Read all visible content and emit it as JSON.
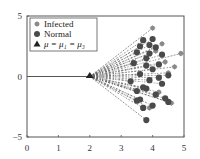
{
  "chart_data": {
    "type": "scatter",
    "title": "",
    "xlabel": "",
    "ylabel": "",
    "xlim": [
      0,
      5
    ],
    "ylim": [
      -5,
      5
    ],
    "xticks": [
      0,
      1,
      2,
      3,
      4,
      5
    ],
    "yticks": [
      5,
      0,
      -5
    ],
    "xtick_labels": [
      "0",
      "1",
      "2",
      "3",
      "4",
      "5"
    ],
    "ytick_labels": [
      "5",
      "0",
      "−5"
    ],
    "grid": false,
    "legend_position": "upper left",
    "legend": [
      {
        "label": "Infected",
        "marker": "star",
        "color": "#8a8a8a"
      },
      {
        "label": "Normal",
        "marker": "circle",
        "color": "#4a4a4a"
      },
      {
        "label": "μ = μ₁ = μ₃",
        "marker": "triangle",
        "color": "#222222"
      }
    ],
    "center": {
      "label": "μ = μ₁ = μ₃",
      "x": 2.0,
      "y": 0.0
    },
    "baseline": {
      "from": [
        0,
        0
      ],
      "to": [
        2.0,
        0
      ]
    },
    "series": [
      {
        "name": "Infected",
        "marker": "star",
        "color": "#8a8a8a",
        "points": [
          [
            4.0,
            4.0
          ],
          [
            4.9,
            1.9
          ],
          [
            4.3,
            2.7
          ],
          [
            4.5,
            0.3
          ],
          [
            4.6,
            -2.2
          ],
          [
            4.2,
            -1.3
          ],
          [
            4.4,
            1.2
          ],
          [
            3.9,
            -2.6
          ],
          [
            4.7,
            0.8
          ],
          [
            4.1,
            2.1
          ]
        ]
      },
      {
        "name": "Normal",
        "marker": "circle",
        "color": "#4a4a4a",
        "points": [
          [
            3.8,
            -3.6
          ],
          [
            3.6,
            -1.9
          ],
          [
            4.5,
            -2.1
          ],
          [
            3.7,
            3.0
          ],
          [
            3.9,
            2.6
          ],
          [
            4.1,
            2.4
          ],
          [
            3.5,
            2.0
          ],
          [
            3.8,
            1.5
          ],
          [
            4.2,
            1.0
          ],
          [
            4.0,
            0.6
          ],
          [
            3.6,
            0.2
          ],
          [
            3.9,
            -0.3
          ],
          [
            4.3,
            -0.6
          ],
          [
            3.7,
            -0.9
          ],
          [
            4.1,
            -1.5
          ],
          [
            3.5,
            -1.2
          ],
          [
            4.4,
            -1.8
          ],
          [
            3.8,
            0.9
          ],
          [
            4.0,
            -2.4
          ],
          [
            3.4,
            1.1
          ],
          [
            4.2,
            -0.1
          ],
          [
            3.6,
            2.5
          ],
          [
            4.3,
            1.8
          ],
          [
            3.9,
            1.9
          ],
          [
            3.7,
            -2.6
          ],
          [
            4.5,
            0.1
          ],
          [
            3.3,
            -0.4
          ],
          [
            3.5,
            -2.0
          ],
          [
            4.0,
            3.1
          ],
          [
            3.8,
            -1.0
          ]
        ]
      }
    ],
    "annotations": "Dashed lines radiate from the center point (2,0) to each sample; concentric white arcs overlay the fan."
  }
}
